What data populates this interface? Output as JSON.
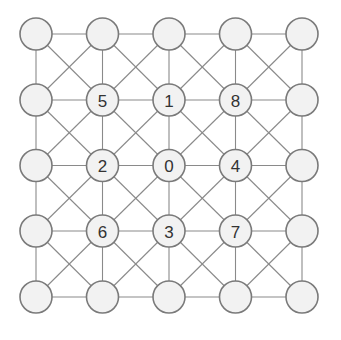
{
  "diagram": {
    "type": "grid-graph",
    "rows": 5,
    "cols": 5,
    "col_x": [
      36,
      102.5,
      169,
      235.5,
      302
    ],
    "row_y": [
      34,
      100,
      165.5,
      231,
      297
    ],
    "node_radius": 16,
    "colors": {
      "node_fill": "#f2f2f2",
      "node_stroke": "#7a7a7a",
      "edge": "#8a8a8a",
      "label": "#333333"
    },
    "labels": [
      [
        "",
        "",
        "",
        "",
        ""
      ],
      [
        "",
        "5",
        "1",
        "8",
        ""
      ],
      [
        "",
        "2",
        "0",
        "4",
        ""
      ],
      [
        "",
        "6",
        "3",
        "7",
        ""
      ],
      [
        "",
        "",
        "",
        "",
        ""
      ]
    ],
    "edges_description": "Each node connects to horizontal and vertical neighbors; diagonal edges form X-crosses within each grid cell."
  }
}
